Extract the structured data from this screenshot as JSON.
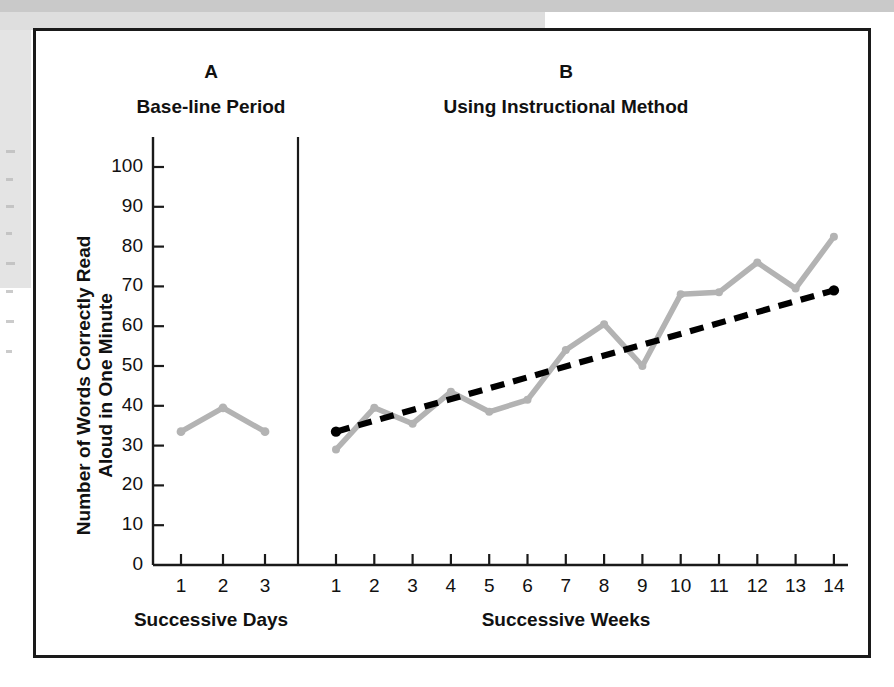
{
  "figure": {
    "y_axis_title": "Number of Words Correctly Read\nAloud in One Minute",
    "y_axis_title_line1": "Number of Words Correctly Read",
    "y_axis_title_line2": "Aloud in One Minute",
    "panel_a_letter": "A",
    "panel_a_title": "Base-line Period",
    "panel_a_xlabel": "Successive Days",
    "panel_b_letter": "B",
    "panel_b_title": "Using Instructional Method",
    "panel_b_xlabel": "Successive Weeks",
    "colors": {
      "data_line": "#b3b3b3",
      "trend_line": "#000000",
      "axis": "#1a1a1a",
      "frame": "#1a1a1a",
      "background": "#ffffff"
    }
  },
  "chart_data": [
    {
      "type": "line",
      "title": "Base-line Period",
      "panel": "A",
      "xlabel": "Successive Days",
      "ylabel": "Number of Words Correctly Read Aloud in One Minute",
      "categories": [
        "1",
        "2",
        "3"
      ],
      "x": [
        1,
        2,
        3
      ],
      "values": [
        33.5,
        39.5,
        33.5
      ],
      "ylim": [
        0,
        100
      ],
      "yticks": [
        0,
        10,
        20,
        30,
        40,
        50,
        60,
        70,
        80,
        90,
        100
      ],
      "xlim": [
        0.5,
        3.5
      ],
      "grid": false,
      "legend": "none",
      "series": [
        {
          "name": "Words read correctly per minute",
          "values": [
            33.5,
            39.5,
            33.5
          ],
          "color": "#b3b3b3",
          "style": "solid",
          "markers": true
        }
      ]
    },
    {
      "type": "line",
      "title": "Using Instructional Method",
      "panel": "B",
      "xlabel": "Successive Weeks",
      "ylabel": "Number of Words Correctly Read Aloud in One Minute",
      "categories": [
        "1",
        "2",
        "3",
        "4",
        "5",
        "6",
        "7",
        "8",
        "9",
        "10",
        "11",
        "12",
        "13",
        "14"
      ],
      "x": [
        1,
        2,
        3,
        4,
        5,
        6,
        7,
        8,
        9,
        10,
        11,
        12,
        13,
        14
      ],
      "values": [
        29,
        39.5,
        35.5,
        43.5,
        38.5,
        41.5,
        54,
        60.5,
        50,
        68,
        68.5,
        76,
        69.5,
        82.5
      ],
      "ylim": [
        0,
        100
      ],
      "yticks": [
        0,
        10,
        20,
        30,
        40,
        50,
        60,
        70,
        80,
        90,
        100
      ],
      "grid": false,
      "legend": "none",
      "series": [
        {
          "name": "Words read correctly per minute",
          "values": [
            29,
            39.5,
            35.5,
            43.5,
            38.5,
            41.5,
            54,
            60.5,
            50,
            68,
            68.5,
            76,
            69.5,
            82.5
          ],
          "color": "#b3b3b3",
          "style": "solid",
          "markers": true
        },
        {
          "name": "Trend line",
          "values": [
            33.5,
            36.2,
            39.0,
            41.7,
            44.5,
            47.2,
            50.0,
            52.7,
            55.5,
            58.2,
            61.0,
            63.7,
            66.3,
            69.0
          ],
          "color": "#000000",
          "style": "dashed",
          "markers": "endpoints",
          "endpoints": [
            {
              "x": 1,
              "y": 33.5
            },
            {
              "x": 14,
              "y": 69.0
            }
          ]
        }
      ]
    }
  ],
  "axis": {
    "y_ticks": [
      "100",
      "90",
      "80",
      "70",
      "60",
      "50",
      "40",
      "30",
      "20",
      "10",
      "0"
    ],
    "x_ticks_panel_a": [
      "1",
      "2",
      "3"
    ],
    "x_ticks_panel_b": [
      "1",
      "2",
      "3",
      "4",
      "5",
      "6",
      "7",
      "8",
      "9",
      "10",
      "11",
      "12",
      "13",
      "14"
    ]
  }
}
